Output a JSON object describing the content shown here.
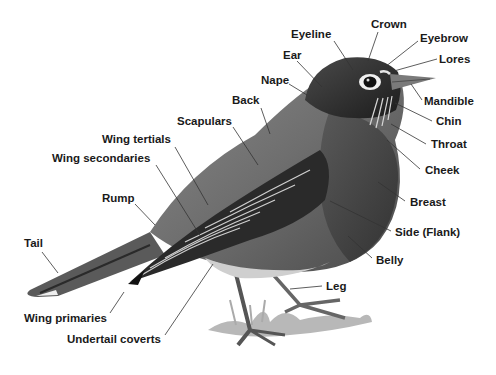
{
  "diagram": {
    "labels": [
      {
        "id": "crown",
        "text": "Crown",
        "x": 371,
        "y": 28,
        "lx1": 378,
        "ly1": 32,
        "lx2": 368,
        "ly2": 61
      },
      {
        "id": "eyeline",
        "text": "Eyeline",
        "x": 291,
        "y": 38,
        "lx1": 334,
        "ly1": 41,
        "lx2": 353,
        "ly2": 70
      },
      {
        "id": "eyebrow",
        "text": "Eyebrow",
        "x": 420,
        "y": 42,
        "lx1": 418,
        "ly1": 41,
        "lx2": 385,
        "ly2": 67
      },
      {
        "id": "ear",
        "text": "Ear",
        "x": 283,
        "y": 59,
        "lx1": 297,
        "ly1": 61,
        "lx2": 322,
        "ly2": 87
      },
      {
        "id": "lores",
        "text": "Lores",
        "x": 439,
        "y": 63,
        "lx1": 437,
        "ly1": 59,
        "lx2": 394,
        "ly2": 71
      },
      {
        "id": "nape",
        "text": "Nape",
        "x": 261,
        "y": 84,
        "lx1": 289,
        "ly1": 84,
        "lx2": 307,
        "ly2": 95
      },
      {
        "id": "mandible",
        "text": "Mandible",
        "x": 424,
        "y": 105,
        "lx1": 422,
        "ly1": 100,
        "lx2": 411,
        "ly2": 84
      },
      {
        "id": "back",
        "text": "Back",
        "x": 232,
        "y": 104,
        "lx1": 261,
        "ly1": 108,
        "lx2": 270,
        "ly2": 134
      },
      {
        "id": "chin",
        "text": "Chin",
        "x": 436,
        "y": 125,
        "lx1": 432,
        "ly1": 121,
        "lx2": 395,
        "ly2": 103
      },
      {
        "id": "scapulars",
        "text": "Scapulars",
        "x": 177,
        "y": 125,
        "lx1": 233,
        "ly1": 127,
        "lx2": 258,
        "ly2": 165
      },
      {
        "id": "throat",
        "text": "Throat",
        "x": 431,
        "y": 148,
        "lx1": 426,
        "ly1": 144,
        "lx2": 391,
        "ly2": 124
      },
      {
        "id": "wing-tertials",
        "text": "Wing tertials",
        "x": 102,
        "y": 143,
        "lx1": 175,
        "ly1": 147,
        "lx2": 208,
        "ly2": 205
      },
      {
        "id": "wing-secondaries",
        "text": "Wing secondaries",
        "x": 52,
        "y": 162,
        "lx1": 156,
        "ly1": 165,
        "lx2": 201,
        "ly2": 237
      },
      {
        "id": "cheek",
        "text": "Cheek",
        "x": 425,
        "y": 174,
        "lx1": 420,
        "ly1": 169,
        "lx2": 387,
        "ly2": 140
      },
      {
        "id": "breast",
        "text": "Breast",
        "x": 410,
        "y": 206,
        "lx1": 405,
        "ly1": 201,
        "lx2": 378,
        "ly2": 182
      },
      {
        "id": "rump",
        "text": "Rump",
        "x": 102,
        "y": 202,
        "lx1": 135,
        "ly1": 204,
        "lx2": 155,
        "ly2": 225
      },
      {
        "id": "side-flank",
        "text": "Side (Flank)",
        "x": 395,
        "y": 236,
        "lx1": 391,
        "ly1": 231,
        "lx2": 330,
        "ly2": 201
      },
      {
        "id": "tail",
        "text": "Tail",
        "x": 24,
        "y": 247,
        "lx1": 42,
        "ly1": 252,
        "lx2": 58,
        "ly2": 273
      },
      {
        "id": "belly",
        "text": "Belly",
        "x": 376,
        "y": 264,
        "lx1": 372,
        "ly1": 258,
        "lx2": 348,
        "ly2": 236
      },
      {
        "id": "leg",
        "text": "Leg",
        "x": 326,
        "y": 290,
        "lx1": 322,
        "ly1": 286,
        "lx2": 290,
        "ly2": 289
      },
      {
        "id": "wing-primaries",
        "text": "Wing primaries",
        "x": 24,
        "y": 322,
        "lx1": 110,
        "ly1": 313,
        "lx2": 124,
        "ly2": 292
      },
      {
        "id": "undertail-coverts",
        "text": "Undertail coverts",
        "x": 67,
        "y": 343,
        "lx1": 165,
        "ly1": 335,
        "lx2": 213,
        "ly2": 264
      }
    ]
  }
}
